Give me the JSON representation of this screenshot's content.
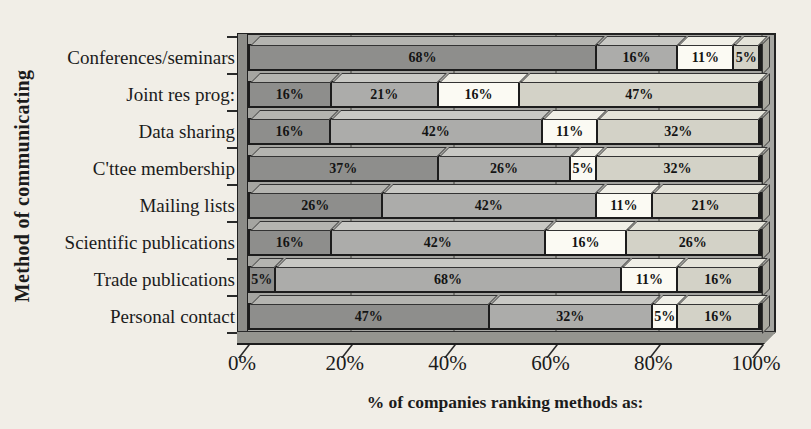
{
  "page": {
    "background": "#f1eee7"
  },
  "colors": {
    "plot_bg": "#a5a5a1",
    "wall": "#8c8c88",
    "floor": "#95958f",
    "gridline": "#73736e",
    "outline": "#1c1c1c"
  },
  "chart_data": {
    "type": "bar",
    "orientation": "horizontal-stacked",
    "xlabel": "% of companies ranking methods as:",
    "ylabel": "Method of communicating",
    "x_ticks": [
      "0%",
      "20%",
      "40%",
      "60%",
      "80%",
      "100%"
    ],
    "xlim": [
      0,
      100
    ],
    "grid": "vertical lines at 20% intervals",
    "legend": "not shown",
    "label_format": "{v}%",
    "categories": [
      "Conferences/seminars",
      "Joint res prog:",
      "Data sharing",
      "C'ttee membership",
      "Mailing lists",
      "Scientific publications",
      "Trade publications",
      "Personal contact"
    ],
    "series": [
      {
        "name": "segment-1",
        "color": "#8e8e8c",
        "top_color": "#b4b4b0",
        "side_color": "#6f6f6b",
        "values": [
          68,
          16,
          16,
          37,
          26,
          16,
          5,
          47
        ]
      },
      {
        "name": "segment-2",
        "color": "#acacaa",
        "top_color": "#c8c8c4",
        "side_color": "#8b8b89",
        "values": [
          16,
          21,
          42,
          26,
          42,
          42,
          68,
          32
        ]
      },
      {
        "name": "segment-3",
        "color": "#fbfaf3",
        "top_color": "#f0efe7",
        "side_color": "#c9c8c0",
        "values": [
          11,
          16,
          11,
          5,
          11,
          16,
          11,
          5
        ]
      },
      {
        "name": "segment-4",
        "color": "#d3d2c7",
        "top_color": "#e4e3d9",
        "side_color": "#a9a89f",
        "values": [
          5,
          47,
          32,
          32,
          21,
          26,
          16,
          16
        ]
      }
    ]
  }
}
